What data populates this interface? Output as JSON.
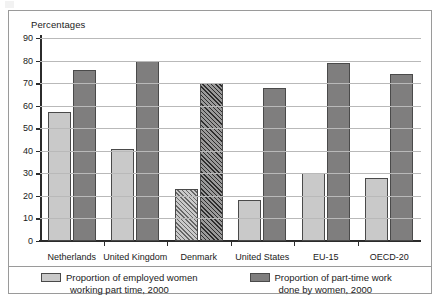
{
  "figure": {
    "y_axis_title": "Percentages"
  },
  "chart_data": {
    "type": "bar",
    "title": "",
    "subtitle": "",
    "xlabel": "",
    "ylabel": "Percentages",
    "ylim": [
      0,
      90
    ],
    "yticks": [
      0,
      10,
      20,
      30,
      40,
      50,
      60,
      70,
      80,
      90
    ],
    "ytick_labels": [
      "0",
      "10",
      "20",
      "30",
      "40",
      "50",
      "60",
      "70",
      "80",
      "90"
    ],
    "grid": true,
    "legend_position": "bottom",
    "categories": [
      "Netherlands",
      "United Kingdom",
      "Denmark",
      "United States",
      "EU-15",
      "OECD-20"
    ],
    "series": [
      {
        "name": "Proportion of employed women working part time, 2000",
        "color": "#c9c9c9",
        "values": [
          57,
          41,
          23,
          18,
          30,
          28
        ]
      },
      {
        "name": "Proportion of part-time work done by women, 2000",
        "color": "#7f7e7e",
        "values": [
          76,
          80,
          70,
          68,
          79,
          74
        ]
      }
    ],
    "highlighted_category": "Denmark",
    "highlight_style": "diagonal-hatch"
  },
  "legend": {
    "items": [
      {
        "swatch": "light",
        "line1": "Proportion of employed women",
        "line2": "working part time, 2000"
      },
      {
        "swatch": "dark",
        "line1": "Proportion of part-time work",
        "line2": "done by women, 2000"
      }
    ]
  }
}
